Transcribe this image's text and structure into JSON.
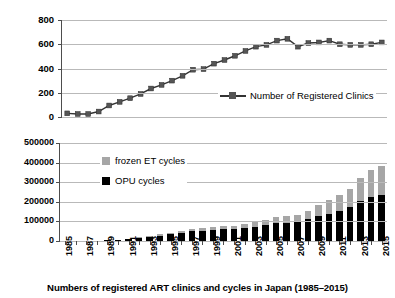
{
  "caption": "Numbers of registered ART clinics and cycles in Japan (1985–2015)",
  "colors": {
    "opu": "#000000",
    "frozen": "#a6a6a6",
    "line": "#333333",
    "marker": "#555555",
    "grid": "#b9b9b9",
    "axis": "#4d4d4d",
    "background": "#ffffff"
  },
  "top_chart": {
    "legend_label": "Number of Registered Clinics",
    "y_ticks": [
      "800",
      "600",
      "400",
      "200",
      "0"
    ]
  },
  "bottom_chart": {
    "legend": [
      {
        "label": "frozen ET cycles",
        "color": "#a6a6a6"
      },
      {
        "label": "OPU cycles",
        "color": "#000000"
      }
    ],
    "y_ticks": [
      "500000",
      "400000",
      "300000",
      "200000",
      "100000",
      "0"
    ]
  },
  "x_axis": {
    "years": [
      1985,
      1986,
      1987,
      1988,
      1989,
      1990,
      1991,
      1992,
      1993,
      1994,
      1995,
      1996,
      1997,
      1998,
      1999,
      2000,
      2001,
      2002,
      2003,
      2004,
      2005,
      2006,
      2007,
      2008,
      2009,
      2010,
      2011,
      2012,
      2013,
      2014,
      2015
    ],
    "labels": [
      "1985",
      "",
      "1987",
      "",
      "1989",
      "",
      "1991",
      "",
      "1993",
      "",
      "1995",
      "",
      "1997",
      "",
      "1999",
      "",
      "2001",
      "",
      "2003",
      "",
      "2005",
      "",
      "2007",
      "",
      "2009",
      "",
      "2011",
      "",
      "2013",
      "",
      "2015"
    ]
  },
  "chart_data": [
    {
      "type": "line",
      "title": "Number of Registered Clinics",
      "xlabel": "",
      "ylabel": "",
      "ylim": [
        0,
        800
      ],
      "ytick_values": [
        0,
        200,
        400,
        600,
        800
      ],
      "grid": true,
      "legend_position": "inside-right",
      "x": [
        1985,
        1986,
        1987,
        1988,
        1989,
        1990,
        1991,
        1992,
        1993,
        1994,
        1995,
        1996,
        1997,
        1998,
        1999,
        2000,
        2001,
        2002,
        2003,
        2004,
        2005,
        2006,
        2007,
        2008,
        2009,
        2010,
        2011,
        2012,
        2013,
        2014,
        2015
      ],
      "series": [
        {
          "name": "Number of Registered Clinics",
          "marker": "square",
          "color": "#333333",
          "values": [
            30,
            25,
            25,
            45,
            95,
            125,
            155,
            190,
            235,
            265,
            300,
            340,
            390,
            395,
            440,
            470,
            505,
            545,
            580,
            595,
            630,
            645,
            580,
            610,
            615,
            630,
            600,
            595,
            595,
            600,
            615
          ]
        }
      ]
    },
    {
      "type": "bar",
      "subtype": "stacked",
      "title": "",
      "xlabel": "",
      "ylabel": "",
      "ylim": [
        0,
        500000
      ],
      "ytick_values": [
        0,
        100000,
        200000,
        300000,
        400000,
        500000
      ],
      "grid": true,
      "legend_position": "inside-left",
      "categories": [
        1985,
        1986,
        1987,
        1988,
        1989,
        1990,
        1991,
        1992,
        1993,
        1994,
        1995,
        1996,
        1997,
        1998,
        1999,
        2000,
        2001,
        2002,
        2003,
        2004,
        2005,
        2006,
        2007,
        2008,
        2009,
        2010,
        2011,
        2012,
        2013,
        2014,
        2015
      ],
      "series": [
        {
          "name": "OPU cycles",
          "color": "#000000",
          "values": [
            200,
            400,
            800,
            1500,
            3000,
            6000,
            11000,
            16000,
            22000,
            28000,
            34000,
            41000,
            49000,
            52000,
            56000,
            60000,
            62000,
            68000,
            74000,
            83000,
            92000,
            93000,
            95000,
            113000,
            128000,
            138000,
            155000,
            171000,
            206000,
            224000,
            235000,
            249000
          ]
        },
        {
          "name": "frozen ET cycles",
          "color": "#a6a6a6",
          "values": [
            0,
            0,
            0,
            100,
            300,
            800,
            1500,
            2500,
            4000,
            5500,
            7000,
            9000,
            11000,
            12000,
            13000,
            15000,
            16000,
            18000,
            21000,
            25000,
            30000,
            33000,
            37000,
            42000,
            57000,
            71000,
            82000,
            95000,
            115000,
            138000,
            150000,
            166000
          ]
        }
      ],
      "totals": [
        200,
        400,
        800,
        1600,
        3300,
        6800,
        12500,
        18500,
        26000,
        33500,
        41000,
        50000,
        60000,
        64000,
        69000,
        75000,
        78000,
        86000,
        95000,
        108000,
        122000,
        126000,
        132000,
        155000,
        185000,
        209000,
        237000,
        266000,
        321000,
        362000,
        385000,
        415000
      ]
    }
  ]
}
